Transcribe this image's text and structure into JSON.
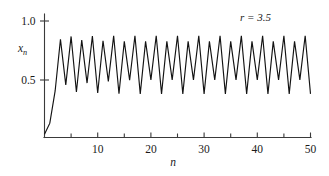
{
  "figure": {
    "background": "#ffffff",
    "line_color": "#131313",
    "axis_color": "#3a3a3a",
    "text_color": "#1a1a1a"
  },
  "annotation": {
    "r_label": "r = 3.5",
    "r_symbol": "r",
    "r_equals": "=",
    "r_value": "3.5"
  },
  "axes": {
    "y_title_base": "x",
    "y_title_sub": "n",
    "x_title": "n",
    "y_ticks": [
      {
        "value": 0.5,
        "label": "0.5"
      },
      {
        "value": 1.0,
        "label": "1.0"
      }
    ],
    "x_ticks": [
      {
        "value": 5,
        "label": ""
      },
      {
        "value": 10,
        "label": "10"
      },
      {
        "value": 15,
        "label": ""
      },
      {
        "value": 20,
        "label": "20"
      },
      {
        "value": 25,
        "label": ""
      },
      {
        "value": 30,
        "label": "30"
      },
      {
        "value": 35,
        "label": ""
      },
      {
        "value": 40,
        "label": "40"
      },
      {
        "value": 45,
        "label": ""
      },
      {
        "value": 50,
        "label": "50"
      }
    ]
  },
  "chart_data": {
    "type": "line",
    "title": "",
    "subtitle": "",
    "xlabel": "n",
    "ylabel": "x_n",
    "annotations": [
      "r = 3.5"
    ],
    "grid": false,
    "legend": "none",
    "xlim": [
      0,
      50
    ],
    "ylim": [
      0.0,
      1.05
    ],
    "x_major_ticks": [
      10,
      20,
      30,
      40,
      50
    ],
    "x_minor_ticks": [
      5,
      15,
      25,
      35,
      45
    ],
    "y_major_ticks": [
      0.5,
      1.0
    ],
    "parameter_r": 3.5,
    "initial_value": 0.04,
    "period4_cycle": [
      0.875,
      0.3828,
      0.8269,
      0.5009
    ],
    "x": [
      0,
      1,
      2,
      3,
      4,
      5,
      6,
      7,
      8,
      9,
      10,
      11,
      12,
      13,
      14,
      15,
      16,
      17,
      18,
      19,
      20,
      21,
      22,
      23,
      24,
      25,
      26,
      27,
      28,
      29,
      30,
      31,
      32,
      33,
      34,
      35,
      36,
      37,
      38,
      39,
      40,
      41,
      42,
      43,
      44,
      45,
      46,
      47,
      48,
      49,
      50
    ],
    "values": [
      0.04,
      0.1344,
      0.4073,
      0.8448,
      0.459,
      0.8692,
      0.3979,
      0.8384,
      0.4741,
      0.8723,
      0.3897,
      0.8325,
      0.4881,
      0.8745,
      0.384,
      0.828,
      0.4983,
      0.875,
      0.3828,
      0.827,
      0.5007,
      0.875,
      0.3828,
      0.8269,
      0.5009,
      0.875,
      0.3828,
      0.8269,
      0.5009,
      0.875,
      0.3828,
      0.8269,
      0.5009,
      0.875,
      0.3828,
      0.8269,
      0.5009,
      0.875,
      0.3828,
      0.8269,
      0.5009,
      0.875,
      0.3828,
      0.8269,
      0.5009,
      0.875,
      0.3828,
      0.8269,
      0.5009,
      0.875,
      0.3828
    ]
  }
}
